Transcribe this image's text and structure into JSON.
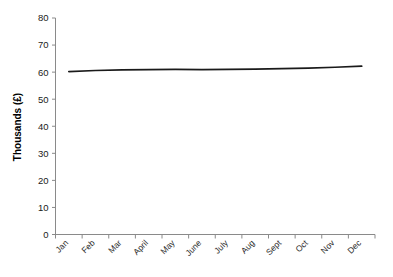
{
  "chart_data": {
    "type": "line",
    "title": "",
    "subtitle": "",
    "xlabel": "",
    "ylabel": "Thousands (£)",
    "categories": [
      "Jan",
      "Feb",
      "Mar",
      "April",
      "May",
      "June",
      "July",
      "Aug",
      "Sept",
      "Oct",
      "Nov",
      "Dec"
    ],
    "series": [
      {
        "name": "",
        "values": [
          60.2,
          60.6,
          60.8,
          60.9,
          61.0,
          60.9,
          61.0,
          61.1,
          61.3,
          61.5,
          61.8,
          62.2
        ]
      }
    ],
    "ylim": [
      0,
      80
    ],
    "yticks": [
      0,
      10,
      20,
      30,
      40,
      50,
      60,
      70,
      80
    ],
    "ytick_labels": [
      "0",
      "10",
      "20",
      "30",
      "40",
      "50",
      "60",
      "70",
      "80"
    ],
    "grid": false,
    "legend": false,
    "legend_position": "none",
    "line_color": "#1a1a1a",
    "axis_color": "#808080",
    "background_color": "#ffffff",
    "xtick_label_rotation": 45
  }
}
